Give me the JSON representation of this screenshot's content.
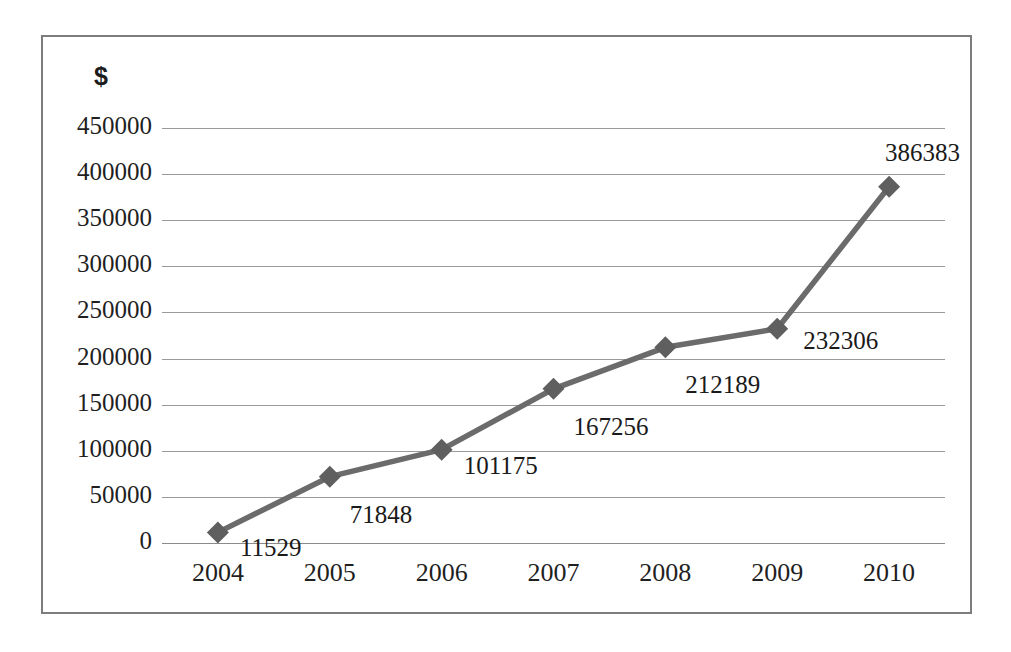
{
  "chart_data": {
    "type": "line",
    "title": "",
    "subtitle": "",
    "xlabel": "",
    "ylabel": "$",
    "categories": [
      "2004",
      "2005",
      "2006",
      "2007",
      "2008",
      "2009",
      "2010"
    ],
    "values": [
      11529,
      71848,
      101175,
      167256,
      212189,
      232306,
      386383
    ],
    "series": [
      {
        "name": "",
        "values": [
          11529,
          71848,
          101175,
          167256,
          212189,
          232306,
          386383
        ]
      }
    ],
    "point_labels": [
      "11529",
      "71848",
      "101175",
      "167256",
      "212189",
      "232306",
      "386383"
    ],
    "ylim": [
      0,
      450000
    ],
    "ytick_labels": [
      "450000",
      "400000",
      "350000",
      "300000",
      "250000",
      "200000",
      "150000",
      "100000",
      "50000",
      "0"
    ],
    "ytick_values": [
      450000,
      400000,
      350000,
      300000,
      250000,
      200000,
      150000,
      100000,
      50000,
      0
    ],
    "ytick_step": 50000,
    "grid": true,
    "legend": false,
    "legend_position": "none",
    "marker": "diamond",
    "line_color": "#6b6b6b",
    "marker_color": "#5f5f5f",
    "grid_color": "#9a9a9a",
    "text_color": "#1f1f1f",
    "background_color": "#ffffff",
    "border_color": "#7d7d7d"
  },
  "axis": {
    "unit_symbol": "$"
  }
}
